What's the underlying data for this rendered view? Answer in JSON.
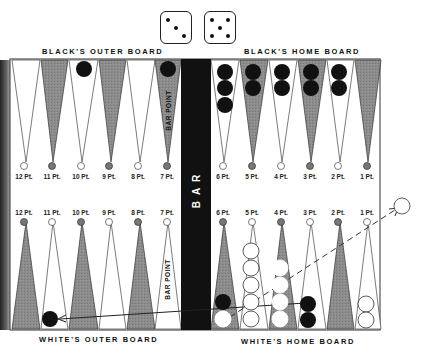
{
  "header": {
    "black_outer_board": "BLACK'S OUTER BOARD",
    "black_home_board": "BLACK'S HOME BOARD"
  },
  "footer": {
    "white_outer_board": "WHITE'S OUTER BOARD",
    "white_home_board": "WHITE'S HOME BOARD"
  },
  "dice": [
    {
      "value": 3
    },
    {
      "value": 5
    }
  ],
  "bar": {
    "label": "BAR",
    "bar_point_label": "BAR POINT"
  },
  "top_points": [
    "12 Pt.",
    "11 Pt.",
    "10 Pt.",
    "9 Pt.",
    "8 Pt.",
    "7 Pt.",
    "6 Pt.",
    "5 Pt.",
    "4 Pt.",
    "3 Pt.",
    "2 Pt.",
    "1 Pt."
  ],
  "bottom_points": [
    "12 Pt.",
    "11 Pt.",
    "10 Pt.",
    "9 Pt.",
    "8 Pt.",
    "7 Pt.",
    "6 Pt.",
    "5 Pt.",
    "4 Pt.",
    "3 Pt.",
    "2 Pt.",
    "1 Pt."
  ],
  "checkers": {
    "top": [
      {
        "point": "10 Pt.",
        "color": "black",
        "count": 1
      },
      {
        "point": "7 Pt.",
        "color": "black",
        "count": 1
      },
      {
        "point": "6 Pt.",
        "color": "black",
        "count": 3
      },
      {
        "point": "5 Pt.",
        "color": "black",
        "count": 2
      },
      {
        "point": "4 Pt.",
        "color": "black",
        "count": 2
      },
      {
        "point": "3 Pt.",
        "color": "black",
        "count": 2
      },
      {
        "point": "2 Pt.",
        "color": "black",
        "count": 2
      }
    ],
    "bottom": [
      {
        "point": "11 Pt.",
        "color": "black",
        "count": 1
      },
      {
        "point": "6 Pt.",
        "color": "black",
        "count": 1
      },
      {
        "point": "6 Pt.",
        "color": "white",
        "count": 1
      },
      {
        "point": "5 Pt.",
        "color": "white",
        "count": 5
      },
      {
        "point": "4 Pt.",
        "color": "white",
        "count": 4
      },
      {
        "point": "3 Pt.",
        "color": "black",
        "count": 2
      },
      {
        "point": "1 Pt.",
        "color": "white",
        "count": 2
      },
      {
        "point": "off-board",
        "color": "white",
        "count": 1
      }
    ]
  },
  "colors": {
    "dark_point": "#8a8a8a",
    "light_point": "#ffffff",
    "bar": "#111111",
    "black_checker": "#111111",
    "white_checker": "#ffffff"
  }
}
